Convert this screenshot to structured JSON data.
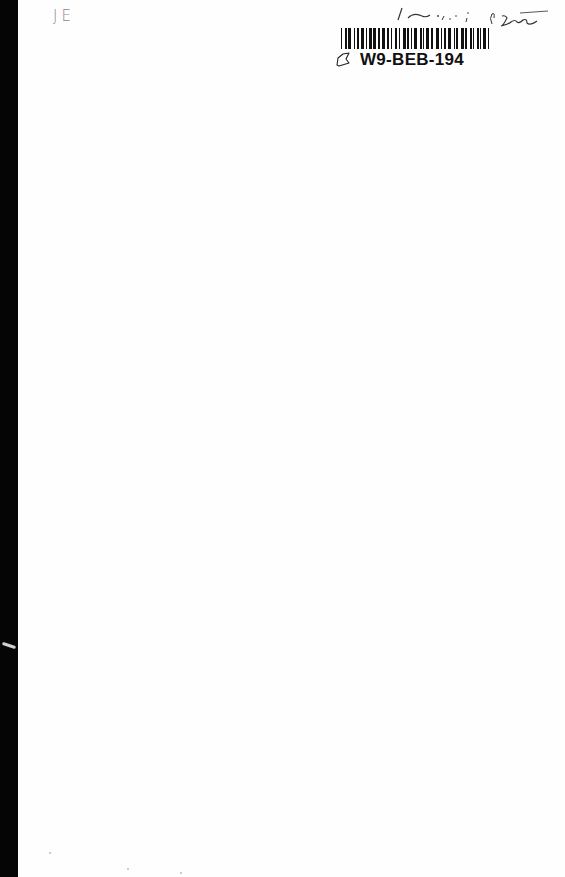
{
  "document": {
    "type": "blank book endpaper / flyleaf",
    "initials": "JE",
    "handwritten_note": "/ ~ ; . , , : 0'Lee",
    "barcode": {
      "label": "W9-BEB-194",
      "icon": "tag-outline-icon"
    }
  }
}
